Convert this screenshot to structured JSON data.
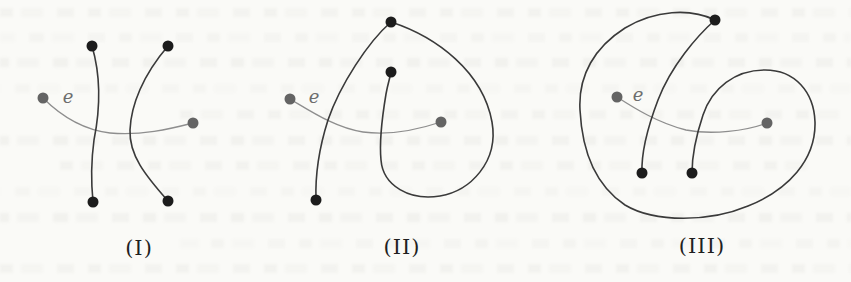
{
  "colors": {
    "background": "#fafaf7",
    "black_edge": "#3a3a3a",
    "black_vertex": "#1c1c1c",
    "gray_edge": "#8e8e8e",
    "gray_vertex": "#646464",
    "caption_text": "#1f1f1f",
    "edge_label_text": "#6d6d6d"
  },
  "stroke": {
    "black_width": 1.6,
    "gray_width": 1.3
  },
  "vertex_radius": 5.5,
  "figures": [
    {
      "id": "I",
      "label": "(I)",
      "label_pos": {
        "x": 139,
        "y": 248
      },
      "edge_label": "e",
      "edge_label_pos": {
        "x": 68,
        "y": 96
      },
      "gray_edge": {
        "path": "M 43 98 C 62 117, 85 130, 110 133 C 140 136, 170 129, 193 123"
      },
      "gray_vertices": [
        [
          43,
          98
        ],
        [
          193,
          123
        ]
      ],
      "black_edges": [
        {
          "path": "M 92 46 C 102 80, 99 115, 94 140 C 91 162, 91 182, 93 202"
        },
        {
          "path": "M 168 46 C 143 75, 131 105, 130 130 C 129 155, 145 175, 168 201"
        }
      ],
      "black_vertices": [
        [
          92,
          46
        ],
        [
          168,
          46
        ],
        [
          93,
          202
        ],
        [
          168,
          201
        ]
      ]
    },
    {
      "id": "II",
      "label": "(II)",
      "label_pos": {
        "x": 402,
        "y": 247
      },
      "edge_label": "e",
      "edge_label_pos": {
        "x": 314,
        "y": 96
      },
      "gray_edge": {
        "path": "M 290 99 C 312 112, 336 128, 363 132 C 392 136, 420 129, 441 122"
      },
      "gray_vertices": [
        [
          290,
          99
        ],
        [
          441,
          122
        ]
      ],
      "black_edges": [
        {
          "path": "M 391 22 C 368 42, 340 85, 328 120 C 321 142, 315 172, 316 200"
        },
        {
          "path": "M 391 22 C 437 37, 483 72, 492 122 C 499 162, 470 191, 440 196 C 410 201, 383 186, 381 160 C 379 140, 383 112, 386 94 C 388 83, 390 78, 391 72"
        }
      ],
      "black_vertices": [
        [
          391,
          22
        ],
        [
          391,
          72
        ],
        [
          316,
          200
        ]
      ]
    },
    {
      "id": "III",
      "label": "(III)",
      "label_pos": {
        "x": 702,
        "y": 246
      },
      "edge_label": "e",
      "edge_label_pos": {
        "x": 638,
        "y": 94
      },
      "gray_edge": {
        "path": "M 617 97 C 634 108, 658 123, 686 130 C 712 135, 746 131, 767 123"
      },
      "gray_vertices": [
        [
          617,
          97
        ],
        [
          767,
          123
        ]
      ],
      "black_edges": [
        {
          "path": "M 715 20 C 697 36, 671 66, 658 100 C 650 121, 641 148, 642 173"
        },
        {
          "path": "M 715 20 C 690 8, 655 10, 625 28 C 595 47, 578 75, 580 110 C 582 150, 595 185, 625 205 C 655 223, 710 222, 748 206 C 788 190, 816 160, 815 122 C 814 92, 795 70, 765 70 C 735 70, 712 88, 703 115 C 697 133, 692 152, 692 173"
        }
      ],
      "black_vertices": [
        [
          715,
          20
        ],
        [
          642,
          173
        ],
        [
          692,
          173
        ]
      ]
    }
  ]
}
